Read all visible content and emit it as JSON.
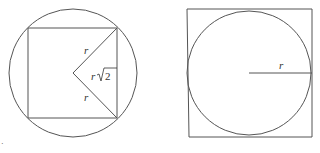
{
  "figures": {
    "left": {
      "description": "Square inscribed in a circle with two radii drawn to adjacent corners",
      "circle": {
        "cx": 73,
        "cy": 73,
        "r": 64
      },
      "square": {
        "x": 28,
        "y": 28,
        "width": 89,
        "height": 90
      },
      "center_point": {
        "x": 73,
        "y": 73
      },
      "upper_radius_end": {
        "x": 117,
        "y": 28
      },
      "lower_radius_end": {
        "x": 117,
        "y": 118
      },
      "labels": {
        "upper_radius": "r",
        "lower_radius": "r",
        "side_prefix": "r",
        "side_root_value": "2"
      }
    },
    "right": {
      "description": "Circle inscribed in a square with one radius drawn",
      "square": {
        "tl": [
          187,
          9
        ],
        "tr": [
          312,
          9
        ],
        "br": [
          312,
          137
        ],
        "bl": [
          189,
          137
        ]
      },
      "circle": {
        "cx": 249,
        "cy": 73,
        "r": 62
      },
      "radius_line": {
        "x1": 249,
        "y1": 73,
        "x2": 312,
        "y2": 73
      },
      "labels": {
        "radius": "r"
      }
    }
  },
  "colors": {
    "stroke": "#555555",
    "text": "#333333",
    "background": "#ffffff"
  },
  "stray_mark": "·"
}
